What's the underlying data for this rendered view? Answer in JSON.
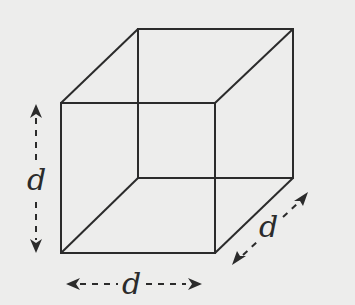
{
  "diagram": {
    "shape": "cube",
    "labels": {
      "height": "d",
      "width": "d",
      "depth": "d"
    },
    "colors": {
      "background": "#ededec",
      "stroke": "#2b2b2b"
    },
    "vertices": {
      "front_top_left": [
        61,
        103
      ],
      "front_top_right": [
        215,
        103
      ],
      "front_bottom_left": [
        61,
        253
      ],
      "front_bottom_right": [
        215,
        253
      ],
      "back_top_left": [
        138,
        29
      ],
      "back_top_right": [
        293,
        29
      ],
      "back_bottom_left": [
        138,
        178
      ],
      "back_bottom_right": [
        293,
        178
      ]
    }
  }
}
